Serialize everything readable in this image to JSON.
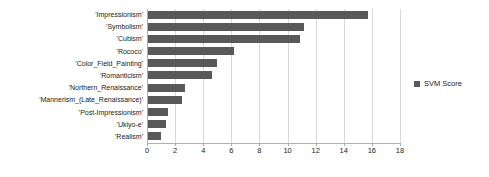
{
  "chart_data": {
    "type": "bar",
    "orientation": "horizontal",
    "title": "",
    "xlabel": "",
    "ylabel": "",
    "xlim": [
      0,
      18
    ],
    "xticks": [
      0,
      2,
      4,
      6,
      8,
      10,
      12,
      14,
      16,
      18
    ],
    "grid": true,
    "legend_position": "right",
    "series": [
      {
        "name": "SVM Score",
        "color": "#595959",
        "values": [
          15.7,
          11.2,
          10.9,
          6.2,
          5.0,
          4.6,
          2.7,
          2.5,
          1.5,
          1.35,
          1.0
        ]
      }
    ],
    "categories": [
      "'Impressionism'",
      "'Symbolism'",
      "'Cubism'",
      "'Rococo'",
      "'Color_Field_Painting'",
      "'Romanticism'",
      "'Northern_Renaissance'",
      "'Mannerism_(Late_Renaissance)'",
      "'Post-Impressionism'",
      "'Ukiyo-e'",
      "'Realism'"
    ]
  },
  "legend": {
    "entries": [
      {
        "label": "SVM Score",
        "color": "#595959"
      }
    ]
  },
  "colors": {
    "bar": "#595959",
    "gridline": "#d9d9d9",
    "axis": "#b0b0b0",
    "text": "#1a1a1a",
    "background": "#ffffff"
  }
}
